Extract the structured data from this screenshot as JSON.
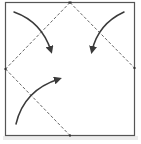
{
  "diagram": {
    "type": "origami-fold-step",
    "colors": {
      "background": "#ffffff",
      "paper_border": "#555555",
      "fold_line": "#555555",
      "arrow": "#3a3a3a",
      "shadow": "#e4e4e4"
    },
    "square": {
      "x": 5,
      "y": 2,
      "width": 130,
      "height": 134
    },
    "fold_lines": [
      {
        "name": "top-to-left",
        "from": [
          70,
          2
        ],
        "to": [
          5,
          69
        ]
      },
      {
        "name": "top-to-right",
        "from": [
          70,
          2
        ],
        "to": [
          135,
          68
        ]
      },
      {
        "name": "left-to-bottom",
        "from": [
          5,
          69
        ],
        "to": [
          70,
          136
        ]
      }
    ],
    "arrows": [
      {
        "name": "top-left-arrow",
        "path": "M14 12 Q42 22 52 54",
        "tip": [
          52,
          54
        ]
      },
      {
        "name": "top-right-arrow",
        "path": "M124 12 Q98 24 92 54",
        "tip": [
          92,
          54
        ]
      },
      {
        "name": "bottom-left-arrow",
        "path": "M16 124 Q24 90 62 78",
        "tip": [
          62,
          78
        ]
      }
    ]
  }
}
